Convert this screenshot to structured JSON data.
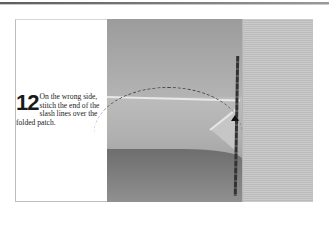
{
  "page": {
    "header_rule": true
  },
  "instruction": {
    "step_number": "12",
    "text": "On the wrong side, stitch the end of the slash lines over the folded patch."
  },
  "photo": {
    "subject": "fabric with slash lines stitched over folded patch, wrong side",
    "annotation": "dashed-arc-pointer"
  },
  "colors": {
    "rule": "#6e6e6e",
    "frame_border": "#bdbdbd",
    "text": "#222222"
  }
}
